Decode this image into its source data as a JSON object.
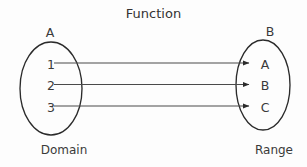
{
  "diagram": {
    "title": "Function",
    "type": "mapping-diagram",
    "colors": {
      "stroke": "#2b2b2b",
      "text": "#3a3a3a",
      "background": "#fdfdfd"
    },
    "domain_set": {
      "set_label": "A",
      "caption": "Domain",
      "elements": [
        "1",
        "2",
        "3"
      ]
    },
    "range_set": {
      "set_label": "B",
      "caption": "Range",
      "elements": [
        "A",
        "B",
        "C"
      ]
    },
    "mappings": [
      {
        "from": "1",
        "to": "A"
      },
      {
        "from": "2",
        "to": "B"
      },
      {
        "from": "3",
        "to": "C"
      }
    ]
  }
}
